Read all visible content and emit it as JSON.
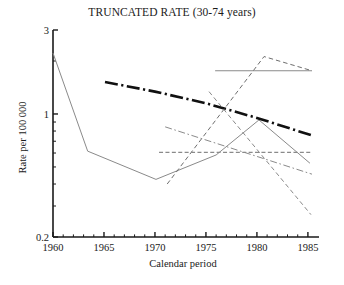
{
  "chart_data": {
    "type": "line",
    "title": "TRUNCATED RATE (30-74 years)",
    "xlabel": "Calendar period",
    "ylabel": "Rate per 100 000",
    "xlim": [
      1960,
      1985.5
    ],
    "ylim": [
      0.2,
      3
    ],
    "yscale": "log",
    "grid": false,
    "legend": "none",
    "xticks": [
      1960,
      1965,
      1970,
      1975,
      1980,
      1985
    ],
    "xticklabels": [
      "1960",
      "1965",
      "1970",
      "1975",
      "1980",
      "1985"
    ],
    "yticks": [
      0.2,
      1,
      3
    ],
    "yticklabels": [
      "0.2",
      "1",
      "3"
    ],
    "yminorticks": [
      0.3,
      0.4,
      0.5,
      0.6,
      0.7,
      0.8,
      0.9,
      2
    ],
    "series": [
      {
        "name": "observed-rate",
        "style": "solid",
        "color": "#8a8a8a",
        "width": 1.0,
        "x": [
          1960,
          1963.4,
          1970.1,
          1976.0,
          1980.2,
          1985.2
        ],
        "y": [
          2.22,
          0.615,
          0.425,
          0.585,
          0.925,
          0.525
        ]
      },
      {
        "name": "fitted-trend-bold",
        "style": "dashdot",
        "color": "#111111",
        "width": 2.6,
        "x": [
          1965.1,
          1970.0,
          1975.0,
          1980.0,
          1985.4
        ],
        "y": [
          1.52,
          1.34,
          1.15,
          0.95,
          0.755
        ]
      },
      {
        "name": "projection-flat-upper",
        "style": "solid",
        "color": "#8a8a8a",
        "width": 1.2,
        "x": [
          1975.9,
          1985.4
        ],
        "y": [
          1.76,
          1.76
        ]
      },
      {
        "name": "projection-peak-dashed",
        "style": "dashed",
        "color": "#6e6e6e",
        "width": 1.0,
        "x": [
          1971.2,
          1980.7,
          1985.4
        ],
        "y": [
          0.4,
          2.12,
          1.76
        ]
      },
      {
        "name": "projection-steep-decline",
        "style": "dashed",
        "color": "#8a8a8a",
        "width": 1.0,
        "x": [
          1975.3,
          1985.3
        ],
        "y": [
          1.34,
          0.268
        ]
      },
      {
        "name": "projection-dashdot-mid",
        "style": "dashdot",
        "color": "#8a8a8a",
        "width": 1.0,
        "x": [
          1971.0,
          1985.4
        ],
        "y": [
          0.845,
          0.455
        ]
      },
      {
        "name": "projection-flat-lower",
        "style": "dashed",
        "color": "#8a8a8a",
        "width": 1.3,
        "x": [
          1970.4,
          1985.4
        ],
        "y": [
          0.605,
          0.605
        ]
      }
    ]
  },
  "axes": {
    "x_title": "Calendar period",
    "y_title": "Rate per 100 000",
    "x_tick_labels": [
      "1960",
      "1965",
      "1970",
      "1975",
      "1980",
      "1985"
    ],
    "y_tick_labels": [
      "3",
      "1",
      "0.2"
    ]
  },
  "header": {
    "title": "TRUNCATED RATE (30-74 years)"
  }
}
